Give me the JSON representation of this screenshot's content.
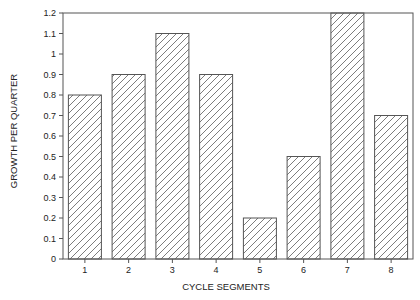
{
  "chart_data": {
    "type": "bar",
    "title": "",
    "xlabel": "CYCLE SEGMENTS",
    "ylabel": "GROWTH PER QUARTER",
    "categories": [
      "1",
      "2",
      "3",
      "4",
      "5",
      "6",
      "7",
      "8"
    ],
    "values": [
      0.8,
      0.9,
      1.1,
      0.9,
      0.2,
      0.5,
      1.2,
      0.7
    ],
    "ylim": [
      0,
      1.2
    ],
    "yticks": [
      "0",
      "0.1",
      "0.2",
      "0.3",
      "0.4",
      "0.5",
      "0.6",
      "0.7",
      "0.8",
      "0.9",
      "1",
      "1.1",
      "1.2"
    ],
    "grid": false,
    "legend": null,
    "bar_fill": "hatched-diagonal",
    "colors": {
      "bar_stroke": "#555555",
      "hatch": "#6e6e6e",
      "axis": "#555555"
    }
  }
}
